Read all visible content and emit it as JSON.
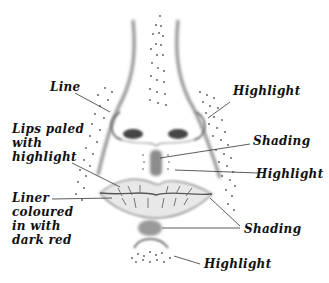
{
  "figure": {
    "colors": {
      "background": "#ffffff",
      "ink": "#111111",
      "shading": "#7a7a7a",
      "dots": "#555555"
    }
  },
  "labels": {
    "line": "Line",
    "lips_paled": "Lips paled\nwith\nhighlight",
    "liner": "Liner\ncoloured\nin with\ndark red",
    "highlight_upper": "Highlight",
    "shading_nose": "Shading",
    "highlight_middle": "Highlight",
    "shading_lips": "Shading",
    "highlight_chin": "Highlight"
  }
}
